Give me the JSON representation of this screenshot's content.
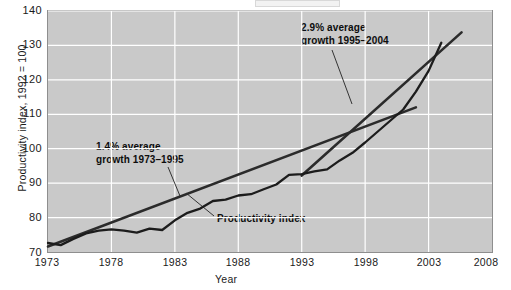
{
  "chart_data": {
    "type": "line",
    "title": "",
    "xlabel": "Year",
    "ylabel": "Productivity index, 1992 = 100",
    "xlim": [
      1973,
      2008
    ],
    "ylim": [
      70,
      140
    ],
    "xticks": [
      1973,
      1978,
      1983,
      1988,
      1993,
      1998,
      2003,
      2008
    ],
    "yticks": [
      70,
      80,
      90,
      100,
      110,
      120,
      130,
      140
    ],
    "grid": true,
    "legend": "none",
    "plot_background": "#c9c9c9",
    "gridline_color": "#ffffff",
    "series": [
      {
        "name": "Productivity index",
        "style": "wiggly-line",
        "color": "#1a1a1a",
        "x": [
          1973,
          1974,
          1975,
          1976,
          1977,
          1978,
          1979,
          1980,
          1981,
          1982,
          1983,
          1984,
          1985,
          1986,
          1987,
          1988,
          1989,
          1990,
          1991,
          1992,
          1993,
          1994,
          1995,
          1996,
          1997,
          1998,
          1999,
          2000,
          2001,
          2002,
          2003,
          2004
        ],
        "values": [
          72.6,
          72.0,
          73.8,
          75.4,
          76.2,
          76.6,
          76.2,
          75.6,
          76.8,
          76.4,
          79.2,
          81.4,
          82.6,
          84.8,
          85.2,
          86.4,
          86.8,
          88.2,
          89.6,
          92.4,
          92.6,
          93.4,
          94.0,
          96.6,
          98.8,
          101.8,
          105.0,
          108.2,
          111.4,
          116.6,
          122.6,
          130.8
        ]
      },
      {
        "name": "1.4% average growth trend 1973-1995",
        "style": "straight-line",
        "color": "#2b2b2b",
        "x": [
          1973,
          2002
        ],
        "values": [
          71.6,
          112.0
        ],
        "annotation": "1.4% average growth 1973–1995"
      },
      {
        "name": "2.9% average growth trend 1995-2004",
        "style": "straight-line",
        "color": "#2b2b2b",
        "x": [
          1993,
          2005.6
        ],
        "values": [
          92.2,
          133.8
        ],
        "annotation": "2.9% average growth 1995–2004"
      }
    ],
    "annotations": [
      {
        "id": "fast-growth",
        "line1": "2.9% average",
        "line2": "growth 1995–2004"
      },
      {
        "id": "slow-growth",
        "line1": "1.4% average",
        "line2": "growth 1973–1995"
      },
      {
        "id": "series-label",
        "text": "Productivity index"
      }
    ]
  },
  "axes": {
    "y_tick_labels": [
      "140",
      "130",
      "120",
      "110",
      "100",
      "90",
      "80",
      "70"
    ],
    "x_tick_labels": [
      "1973",
      "1978",
      "1983",
      "1988",
      "1993",
      "1998",
      "2003",
      "2008"
    ],
    "y_axis_title": "Productivity index, 1992 = 100",
    "x_axis_title": "Year"
  }
}
